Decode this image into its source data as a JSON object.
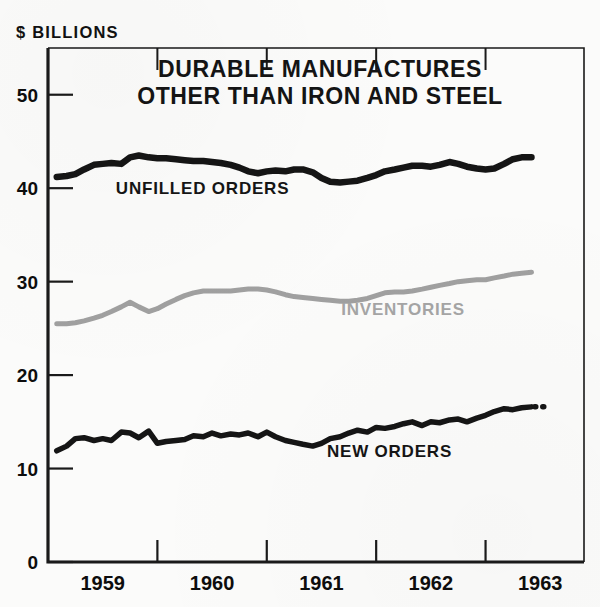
{
  "chart_data": {
    "type": "line",
    "title": "DURABLE MANUFACTURES OTHER THAN IRON AND STEEL",
    "title_line1": "DURABLE MANUFACTURES",
    "title_line2": "OTHER THAN IRON AND STEEL",
    "unit_label": "$ BILLIONS",
    "xlabel": "",
    "ylabel": "$ BILLIONS",
    "ylim": [
      0,
      55
    ],
    "xlim": [
      1958.5,
      1963.4
    ],
    "grid": false,
    "legend_position": "inline-annotations",
    "yticks": [
      0,
      10,
      20,
      30,
      40,
      50
    ],
    "ytick_labels": [
      "0",
      "10",
      "20",
      "30",
      "40",
      "50"
    ],
    "xticks": [
      1959,
      1960,
      1961,
      1962,
      1963
    ],
    "xtick_labels": [
      "1959",
      "1960",
      "1961",
      "1962",
      "1963"
    ],
    "x_boundary_ticks": [
      1959.5,
      1960.5,
      1961.5,
      1962.5
    ],
    "colors": {
      "unfilled_orders": "#151515",
      "inventories": "#a0a0a0",
      "new_orders": "#151515",
      "axis": "#1a1a1a",
      "background": "#fbfbfa"
    },
    "series": [
      {
        "name": "UNFILLED ORDERS",
        "color": "#151515",
        "label_x": 1959.12,
        "label_y": 39.4,
        "label_color": "#151515",
        "stroke_width": 6.5,
        "x": [
          1958.58,
          1958.67,
          1958.75,
          1958.83,
          1958.92,
          1959.0,
          1959.08,
          1959.17,
          1959.25,
          1959.33,
          1959.42,
          1959.5,
          1959.58,
          1959.67,
          1959.75,
          1959.83,
          1959.92,
          1960.0,
          1960.08,
          1960.17,
          1960.25,
          1960.33,
          1960.42,
          1960.5,
          1960.58,
          1960.67,
          1960.75,
          1960.83,
          1960.92,
          1961.0,
          1961.08,
          1961.17,
          1961.25,
          1961.33,
          1961.42,
          1961.5,
          1961.58,
          1961.67,
          1961.75,
          1961.83,
          1961.92,
          1962.0,
          1962.08,
          1962.17,
          1962.25,
          1962.33,
          1962.42,
          1962.5,
          1962.58,
          1962.67,
          1962.75,
          1962.83,
          1962.92
        ],
        "values": [
          41.2,
          41.3,
          41.5,
          42.0,
          42.5,
          42.6,
          42.7,
          42.6,
          43.3,
          43.5,
          43.3,
          43.2,
          43.2,
          43.1,
          43.0,
          42.9,
          42.9,
          42.8,
          42.7,
          42.5,
          42.2,
          41.8,
          41.6,
          41.8,
          41.9,
          41.8,
          42.0,
          42.0,
          41.7,
          41.1,
          40.7,
          40.6,
          40.7,
          40.8,
          41.1,
          41.4,
          41.8,
          42.0,
          42.2,
          42.4,
          42.4,
          42.3,
          42.5,
          42.8,
          42.6,
          42.3,
          42.1,
          42.0,
          42.1,
          42.6,
          43.1,
          43.3,
          43.3
        ]
      },
      {
        "name": "INVENTORIES",
        "color": "#a0a0a0",
        "label_x": 1961.18,
        "label_y": 26.4,
        "label_color": "#a5a5a5",
        "stroke_width": 5.0,
        "x": [
          1958.58,
          1958.67,
          1958.75,
          1958.83,
          1958.92,
          1959.0,
          1959.08,
          1959.17,
          1959.25,
          1959.33,
          1959.42,
          1959.5,
          1959.58,
          1959.67,
          1959.75,
          1959.83,
          1959.92,
          1960.0,
          1960.08,
          1960.17,
          1960.25,
          1960.33,
          1960.42,
          1960.5,
          1960.58,
          1960.67,
          1960.75,
          1960.83,
          1960.92,
          1961.0,
          1961.08,
          1961.17,
          1961.25,
          1961.33,
          1961.42,
          1961.5,
          1961.58,
          1961.67,
          1961.75,
          1961.83,
          1961.92,
          1962.0,
          1962.08,
          1962.17,
          1962.25,
          1962.33,
          1962.42,
          1962.5,
          1962.58,
          1962.67,
          1962.75,
          1962.83,
          1962.92
        ],
        "values": [
          25.5,
          25.5,
          25.6,
          25.8,
          26.1,
          26.4,
          26.8,
          27.3,
          27.8,
          27.3,
          26.8,
          27.1,
          27.6,
          28.1,
          28.5,
          28.8,
          29.0,
          29.0,
          29.0,
          29.0,
          29.1,
          29.2,
          29.2,
          29.1,
          28.9,
          28.6,
          28.4,
          28.3,
          28.2,
          28.1,
          28.0,
          27.9,
          27.9,
          28.0,
          28.2,
          28.5,
          28.8,
          28.9,
          28.9,
          29.0,
          29.2,
          29.4,
          29.6,
          29.8,
          30.0,
          30.1,
          30.2,
          30.2,
          30.4,
          30.6,
          30.8,
          30.9,
          31.0
        ]
      },
      {
        "name": "NEW ORDERS",
        "color": "#151515",
        "label_x": 1961.05,
        "label_y": 11.2,
        "label_color": "#151515",
        "stroke_width": 5.5,
        "has_dotted_extension": true,
        "dotted_extension_x": [
          1962.95,
          1963.05
        ],
        "dotted_extension_value": 16.6,
        "x": [
          1958.58,
          1958.67,
          1958.75,
          1958.83,
          1958.92,
          1959.0,
          1959.08,
          1959.17,
          1959.25,
          1959.33,
          1959.42,
          1959.5,
          1959.58,
          1959.67,
          1959.75,
          1959.83,
          1959.92,
          1960.0,
          1960.08,
          1960.17,
          1960.25,
          1960.33,
          1960.42,
          1960.5,
          1960.58,
          1960.67,
          1960.75,
          1960.83,
          1960.92,
          1961.0,
          1961.08,
          1961.17,
          1961.25,
          1961.33,
          1961.42,
          1961.5,
          1961.58,
          1961.67,
          1961.75,
          1961.83,
          1961.92,
          1962.0,
          1962.08,
          1962.17,
          1962.25,
          1962.33,
          1962.42,
          1962.5,
          1962.58,
          1962.67,
          1962.75,
          1962.83,
          1962.92
        ],
        "values": [
          11.9,
          12.4,
          13.2,
          13.3,
          13.0,
          13.2,
          13.0,
          13.9,
          13.8,
          13.3,
          14.0,
          12.7,
          12.9,
          13.0,
          13.1,
          13.5,
          13.4,
          13.8,
          13.5,
          13.7,
          13.6,
          13.8,
          13.4,
          13.9,
          13.4,
          13.0,
          12.8,
          12.6,
          12.4,
          12.7,
          13.2,
          13.4,
          13.8,
          14.1,
          13.9,
          14.4,
          14.3,
          14.5,
          14.8,
          15.0,
          14.6,
          15.0,
          14.9,
          15.2,
          15.3,
          15.0,
          15.4,
          15.7,
          16.1,
          16.4,
          16.3,
          16.5,
          16.6
        ]
      }
    ]
  }
}
